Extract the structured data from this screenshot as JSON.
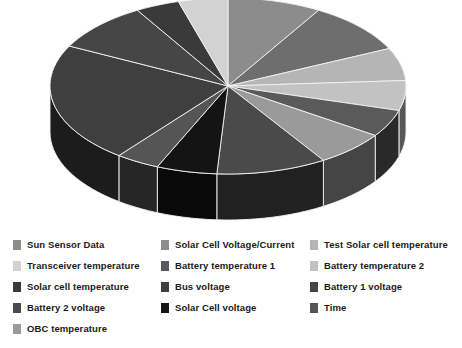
{
  "chart_data": {
    "type": "pie",
    "title": "",
    "subtitle": "",
    "xlabel": "",
    "ylabel": "",
    "legend_position": "bottom",
    "grid": false,
    "three_d": true,
    "start_angle_deg": 0,
    "direction": "clockwise",
    "categories": [
      "Sun Sensor Data",
      "Solar Cell Voltage/Current",
      "Test Solar cell temperature",
      "Transceiver temperature",
      "Battery temperature 1",
      "Battery temperature 2",
      "Solar cell temperature",
      "Bus voltage",
      "Battery 1 voltage",
      "Battery 2 voltage",
      "Solar Cell voltage",
      "Time",
      "OBC temperature"
    ],
    "values": [
      8.5,
      9.5,
      6.0,
      4.5,
      5.0,
      5.5,
      4.0,
      10.0,
      9.0,
      22.0,
      5.5,
      4.0,
      6.5
    ],
    "colors": [
      "#8c8c8c",
      "#6e6e6e",
      "#b5b5b5",
      "#d2d2d2",
      "#5a5a5a",
      "#c2c2c2",
      "#3a3a3a",
      "#4a4a4a",
      "#464646",
      "#3f3f3f",
      "#141414",
      "#555555",
      "#9a9a9a"
    ],
    "slice_order_clockwise_from_top": [
      "Sun Sensor Data",
      "Solar Cell Voltage/Current",
      "Test Solar cell temperature",
      "Battery temperature 2",
      "Battery temperature 1",
      "OBC temperature",
      "Bus voltage",
      "Solar Cell voltage",
      "Time",
      "Battery 2 voltage",
      "Battery 1 voltage",
      "Solar cell temperature",
      "Transceiver temperature"
    ]
  },
  "legend": {
    "columns": [
      {
        "items": [
          {
            "label": "Sun Sensor Data",
            "color": "#8c8c8c"
          },
          {
            "label": "Transceiver temperature",
            "color": "#d2d2d2"
          },
          {
            "label": "Solar cell temperature",
            "color": "#3a3a3a"
          },
          {
            "label": "Battery 2 voltage",
            "color": "#4d4d4d"
          },
          {
            "label": "OBC temperature",
            "color": "#9a9a9a"
          }
        ]
      },
      {
        "items": [
          {
            "label": "Solar Cell Voltage/Current",
            "color": "#8c8c8c"
          },
          {
            "label": "Battery temperature 1",
            "color": "#5a5a5a"
          },
          {
            "label": "Bus voltage",
            "color": "#3d3d3d"
          },
          {
            "label": "Solar Cell voltage",
            "color": "#141414"
          }
        ]
      },
      {
        "items": [
          {
            "label": "Test Solar cell temperature",
            "color": "#b5b5b5"
          },
          {
            "label": "Battery temperature 2",
            "color": "#c2c2c2"
          },
          {
            "label": "Battery 1 voltage",
            "color": "#464646"
          },
          {
            "label": "Time",
            "color": "#555555"
          }
        ]
      }
    ]
  },
  "geometry": {
    "cx": 228,
    "cy": 86,
    "rx": 178,
    "ry": 88,
    "depth": 46,
    "edge_color": "#f2f2f2"
  }
}
